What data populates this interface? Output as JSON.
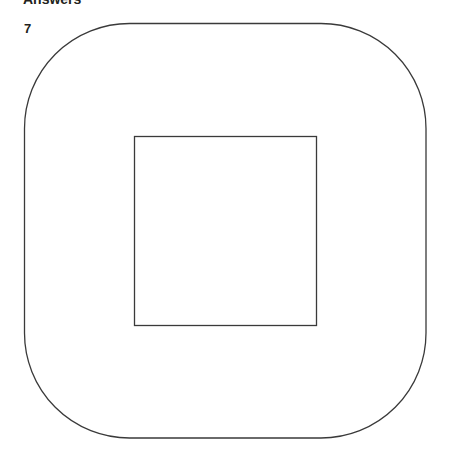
{
  "header": {
    "title": "Answers"
  },
  "question": {
    "number": "7"
  },
  "figure": {
    "stroke_color": "#3a3a3a",
    "outer_shape": {
      "type": "rounded-square",
      "x": 24,
      "y": 23,
      "width": 402,
      "height": 415,
      "corner_radius": 105
    },
    "inner_shape": {
      "type": "square",
      "x": 134,
      "y": 136,
      "width": 182,
      "height": 189
    }
  }
}
